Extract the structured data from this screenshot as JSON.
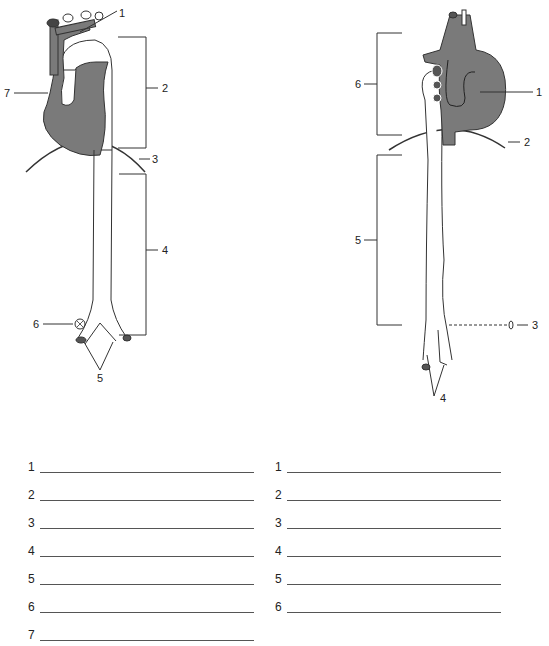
{
  "figure": {
    "left_panel": {
      "view": "anterior",
      "labels": [
        {
          "id": "1",
          "x": 119,
          "y": 8
        },
        {
          "id": "2",
          "x": 162,
          "y": 83
        },
        {
          "id": "3",
          "x": 152,
          "y": 154
        },
        {
          "id": "4",
          "x": 162,
          "y": 243
        },
        {
          "id": "5",
          "x": 97,
          "y": 373
        },
        {
          "id": "6",
          "x": 33,
          "y": 318
        },
        {
          "id": "7",
          "x": 4,
          "y": 90
        }
      ]
    },
    "right_panel": {
      "view": "lateral",
      "labels": [
        {
          "id": "1",
          "x": 536,
          "y": 88
        },
        {
          "id": "2",
          "x": 524,
          "y": 137
        },
        {
          "id": "3",
          "x": 532,
          "y": 321
        },
        {
          "id": "4",
          "x": 440,
          "y": 391
        },
        {
          "id": "5",
          "x": 355,
          "y": 236
        },
        {
          "id": "6",
          "x": 355,
          "y": 81
        }
      ]
    },
    "colors": {
      "tissue": "#7a7a7a",
      "outline": "#333333",
      "vessel_fill": "#ffffff"
    }
  },
  "answers": {
    "left": [
      {
        "num": "1",
        "value": ""
      },
      {
        "num": "2",
        "value": ""
      },
      {
        "num": "3",
        "value": ""
      },
      {
        "num": "4",
        "value": ""
      },
      {
        "num": "5",
        "value": ""
      },
      {
        "num": "6",
        "value": ""
      },
      {
        "num": "7",
        "value": ""
      }
    ],
    "right": [
      {
        "num": "1",
        "value": ""
      },
      {
        "num": "2",
        "value": ""
      },
      {
        "num": "3",
        "value": ""
      },
      {
        "num": "4",
        "value": ""
      },
      {
        "num": "5",
        "value": ""
      },
      {
        "num": "6",
        "value": ""
      }
    ]
  }
}
